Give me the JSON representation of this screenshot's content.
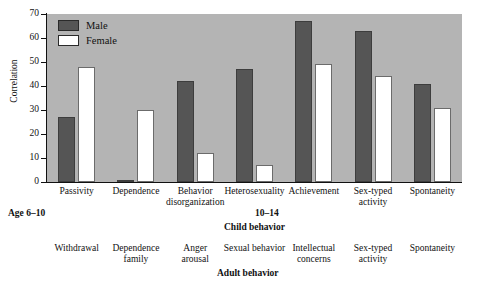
{
  "chart_data": {
    "type": "bar",
    "title": "",
    "xlabel": "",
    "ylabel": "Correlation",
    "ylim": [
      0,
      70
    ],
    "yticks": [
      0,
      10,
      20,
      30,
      40,
      50,
      60,
      70
    ],
    "grid": false,
    "legend_position": "top-left",
    "categories": [
      "Passivity",
      "Dependence",
      "Behavior disorganization",
      "Heterosexuality",
      "Achievement",
      "Sex-typed activity",
      "Spontaneity"
    ],
    "category_lines": [
      [
        "Passivity"
      ],
      [
        "Dependence"
      ],
      [
        "Behavior",
        "disorganization"
      ],
      [
        "Heterosexuality"
      ],
      [
        "Achievement"
      ],
      [
        "Sex-typed",
        "activity"
      ],
      [
        "Spontaneity"
      ]
    ],
    "series": [
      {
        "name": "Male",
        "color": "#555555",
        "values": [
          27,
          1,
          42,
          47,
          67,
          63,
          41
        ]
      },
      {
        "name": "Female",
        "color": "#ffffff",
        "values": [
          48,
          30,
          12,
          7,
          49,
          44,
          31
        ]
      }
    ]
  },
  "legend": {
    "items": [
      {
        "label": "Male",
        "swatch": "#555555"
      },
      {
        "label": "Female",
        "swatch": "#ffffff"
      }
    ]
  },
  "annotations": {
    "age_left": "Age 6–10",
    "age_right": "10–14",
    "child_behavior": "Child behavior",
    "adult_behavior": "Adult behavior"
  },
  "adult_labels": [
    [
      "Withdrawal"
    ],
    [
      "Dependence",
      "family"
    ],
    [
      "Anger",
      "arousal"
    ],
    [
      "Sexual behavior"
    ],
    [
      "Intellectual",
      "concerns"
    ],
    [
      "Sex-typed",
      "activity"
    ],
    [
      "Spontaneity"
    ]
  ]
}
